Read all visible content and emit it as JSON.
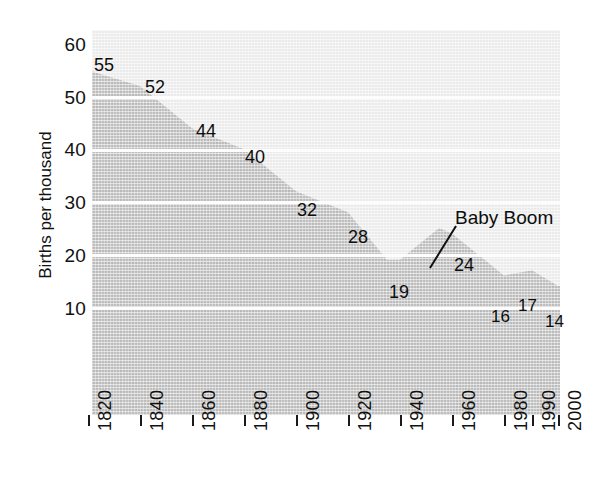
{
  "chart_data": {
    "type": "area",
    "title": "",
    "xlabel": "",
    "ylabel": "Births per thousand",
    "ylim": [
      0,
      60
    ],
    "yticks": [
      10,
      20,
      30,
      40,
      50,
      60
    ],
    "xticks": [
      "1820",
      "1840",
      "1860",
      "1880",
      "1900",
      "1920",
      "1940",
      "1960",
      "1980",
      "1990",
      "2000"
    ],
    "grid": "horizontal-white-gridlines",
    "legend": "none",
    "x": [
      1820,
      1840,
      1860,
      1880,
      1900,
      1920,
      1935,
      1940,
      1955,
      1960,
      1980,
      1990,
      2000
    ],
    "y": [
      55,
      52,
      44,
      40,
      32,
      28,
      19,
      19,
      25,
      24,
      16,
      17,
      14
    ],
    "point_labels": [
      {
        "label": "55",
        "x": 1820,
        "y": 55
      },
      {
        "label": "52",
        "x": 1840,
        "y": 52
      },
      {
        "label": "44",
        "x": 1860,
        "y": 44
      },
      {
        "label": "40",
        "x": 1880,
        "y": 40
      },
      {
        "label": "32",
        "x": 1900,
        "y": 32
      },
      {
        "label": "28",
        "x": 1920,
        "y": 28
      },
      {
        "label": "19",
        "x": 1940,
        "y": 19
      },
      {
        "label": "24",
        "x": 1960,
        "y": 24
      },
      {
        "label": "16",
        "x": 1980,
        "y": 16
      },
      {
        "label": "17",
        "x": 1990,
        "y": 17
      },
      {
        "label": "14",
        "x": 2000,
        "y": 14
      }
    ],
    "annotations": [
      {
        "text": "Baby Boom",
        "points_to_x": 1955,
        "points_to_y": 25
      }
    ],
    "colors": {
      "area_fill": "#bdbdbd",
      "plot_background": "#ebebeb",
      "gridline": "#fdfdfd",
      "text": "#0d0d0d",
      "page_background": "#ffffff"
    }
  },
  "axis": {
    "y_title": "Births per thousand",
    "y_tick_labels": [
      "60",
      "50",
      "40",
      "30",
      "20",
      "10"
    ],
    "x_tick_labels": [
      "1820",
      "1840",
      "1860",
      "1880",
      "1900",
      "1920",
      "1940",
      "1960",
      "1980",
      "1990",
      "2000"
    ]
  },
  "labels": {
    "p1": "55",
    "p2": "52",
    "p3": "44",
    "p4": "40",
    "p5": "32",
    "p6": "28",
    "p7": "19",
    "p8": "24",
    "p9": "16",
    "p10": "17",
    "p11": "14"
  },
  "annotation": {
    "baby_boom": "Baby Boom"
  }
}
